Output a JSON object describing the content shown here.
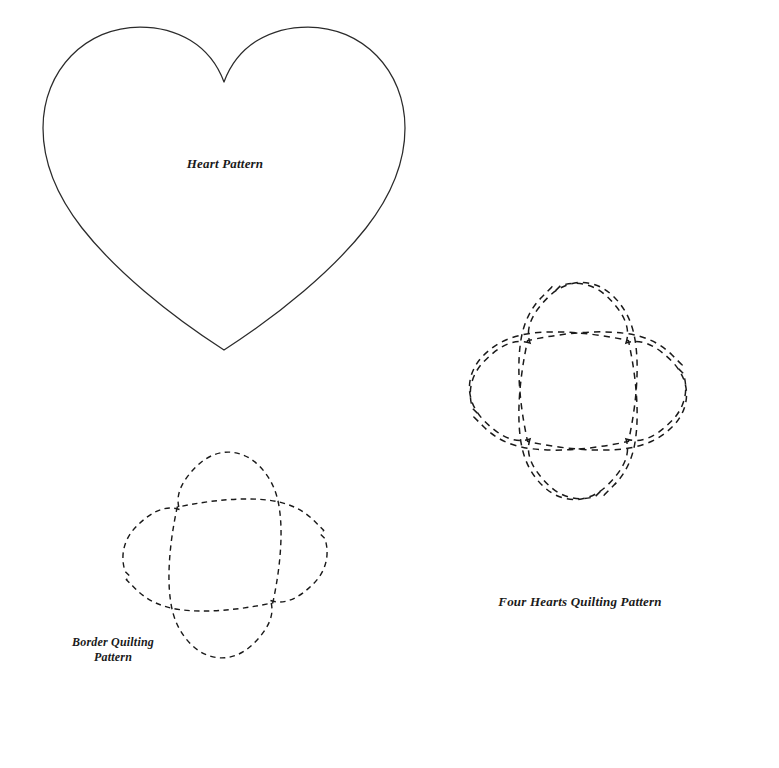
{
  "page": {
    "background_color": "#ffffff",
    "width": 779,
    "height": 768
  },
  "colors": {
    "solid_outline": "#2b2b2b",
    "dashed_outline": "#1a1a1a",
    "label_text": "#1a1a1a",
    "paper": "#ffffff"
  },
  "patterns": [
    {
      "id": "heart-pattern",
      "label": "Heart Pattern",
      "label_lines": [
        "Heart Pattern"
      ],
      "style": "solid",
      "label_position": {
        "x": 225,
        "y": 168
      },
      "bounds": {
        "x": 43,
        "y": 27,
        "width": 358,
        "height": 324
      },
      "description": "Single large heart outline drawn with a continuous solid line"
    },
    {
      "id": "four-hearts-quilting-pattern",
      "label": "Four Hearts Quilting Pattern",
      "label_lines": [
        "Four Hearts Quilting Pattern"
      ],
      "style": "dashed",
      "label_position": {
        "x": 580,
        "y": 606
      },
      "bounds": {
        "x": 392,
        "y": 203,
        "width": 374,
        "height": 366
      },
      "center": {
        "x": 578,
        "y": 391
      },
      "hearts": 4,
      "description": "Four hearts arranged as a clover with tips meeting at the center, drawn in dashed stitch lines"
    },
    {
      "id": "border-quilting-pattern",
      "label": "Border Quilting Pattern",
      "label_lines": [
        "Border Quilting",
        "Pattern"
      ],
      "style": "dashed",
      "label_position": {
        "x": 113,
        "y": 646
      },
      "label_line_height": 16,
      "bounds": {
        "x": 30,
        "y": 420,
        "width": 390,
        "height": 300
      },
      "crossing_point": {
        "x": 225,
        "y": 555
      },
      "hearts": 2,
      "description": "Two hearts placed tip to tip on a diagonal with 180 degree rotational symmetry, drawn in dashed stitch lines"
    }
  ],
  "fonts": {
    "label_size_px": 13,
    "label_size_small_px": 12
  }
}
